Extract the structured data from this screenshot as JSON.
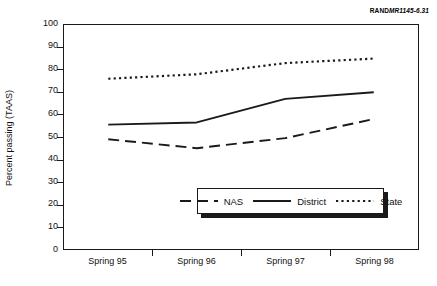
{
  "credit": {
    "brand": "RAND",
    "code": "MR1145-6.31"
  },
  "chart_data": {
    "type": "line",
    "title": "",
    "xlabel": "",
    "ylabel": "Percent passing (TAAS)",
    "categories": [
      "Spring 95",
      "Spring 96",
      "Spring 97",
      "Spring 98"
    ],
    "ylim": [
      0,
      100
    ],
    "yticks": [
      0,
      10,
      20,
      30,
      40,
      50,
      60,
      70,
      80,
      90,
      100
    ],
    "ytick_labels": [
      "0",
      "10",
      "20",
      "30",
      "40",
      "50",
      "60",
      "70",
      "80",
      "90",
      "100"
    ],
    "grid": false,
    "legend_position": "inside lower center",
    "series": [
      {
        "name": "NAS",
        "values": [
          49,
          45,
          49.5,
          58
        ],
        "style": "dashed",
        "color": "#1a1a1a"
      },
      {
        "name": "District",
        "values": [
          55.5,
          56.5,
          67,
          70
        ],
        "style": "solid",
        "color": "#1a1a1a"
      },
      {
        "name": "State",
        "values": [
          76,
          78,
          83,
          85
        ],
        "style": "dotted",
        "color": "#1a1a1a"
      }
    ]
  },
  "legend": {
    "items": [
      {
        "label": "NAS",
        "style": "dashed"
      },
      {
        "label": "District",
        "style": "solid"
      },
      {
        "label": "State",
        "style": "dotted"
      }
    ]
  },
  "colors": {
    "ink": "#1a1a1a",
    "background": "#ffffff"
  }
}
